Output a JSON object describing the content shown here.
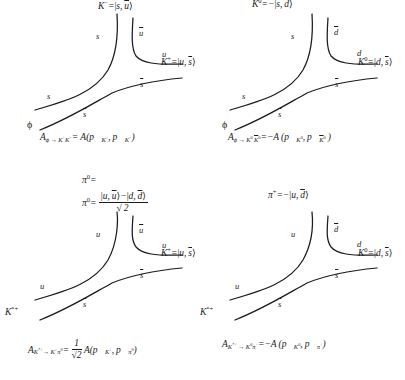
{
  "figure": {
    "type": "quark-flow-diagrams",
    "background_color": "#ffffff",
    "line_color": "#1b1b1b",
    "panels": [
      {
        "id": "phi-to-KplusKminus",
        "position": "top-left",
        "parent_label": "ϕ",
        "top_state_label": "K⁻ = |s, ū⟩",
        "right_state_label": "K⁺ = |u, s̄⟩",
        "quark_labels": [
          "s",
          "s",
          "ū",
          "u",
          "s̄",
          "s̄"
        ],
        "amplitude": "A_{ϕ → K⁺K⁻} = A(p⃗_{K⁺}, p⃗_{K⁻})"
      },
      {
        "id": "phi-to-K0K0bar",
        "position": "top-right",
        "parent_label": "ϕ",
        "top_state_label": "K⁰ = −|s, d̄⟩",
        "right_state_label": "K⁰ = |d, s̄⟩",
        "quark_labels": [
          "s",
          "s",
          "d̄",
          "d",
          "s̄",
          "s̄"
        ],
        "amplitude": "A_{ϕ → K⁰ K̄⁰} = −A(p⃗_{K⁰}, p⃗_{K̄⁰})"
      },
      {
        "id": "Kstar-to-Kpluspi0",
        "position": "bottom-left",
        "parent_label": "K*⁺",
        "top_state_label_1": "π⁰ =",
        "top_state_label_2": "π⁰ = (|u, ū⟩ − |d, d̄⟩) / √2",
        "right_state_label": "K⁺ = |u, s̄⟩",
        "quark_labels": [
          "u",
          "u",
          "ū",
          "u",
          "s̄",
          "s̄"
        ],
        "amplitude": "A_{K*⁺ → K⁺π⁰} = (1/√2) A(p⃗_{K⁺}, p⃗_{π⁰})"
      },
      {
        "id": "Kstar-to-K0piplus",
        "position": "bottom-right",
        "parent_label": "K*⁺",
        "top_state_label": "π⁺ = −|u, d̄⟩",
        "right_state_label": "K⁰ = |d, s̄⟩",
        "quark_labels": [
          "u",
          "u",
          "d̄",
          "d",
          "s̄",
          "s̄"
        ],
        "amplitude": "A_{K*⁺ → K⁰π⁺} = −A(p⃗_{K⁰}, p⃗_{π⁺})"
      }
    ]
  },
  "symbols": {
    "K": "K",
    "pi": "π",
    "phi": "ϕ",
    "u": "u",
    "d": "d",
    "s": "s",
    "A": "A",
    "p": "p",
    "sqrt2": "2",
    "one": "1",
    "minus": "−",
    "eq": "=",
    "arrow": "→",
    "star": "*",
    "ketL": "|",
    "ketR": "⟩",
    "comma": ",",
    "parenL": "(",
    "parenR": ")",
    "plus": "+",
    "zero": "0"
  }
}
